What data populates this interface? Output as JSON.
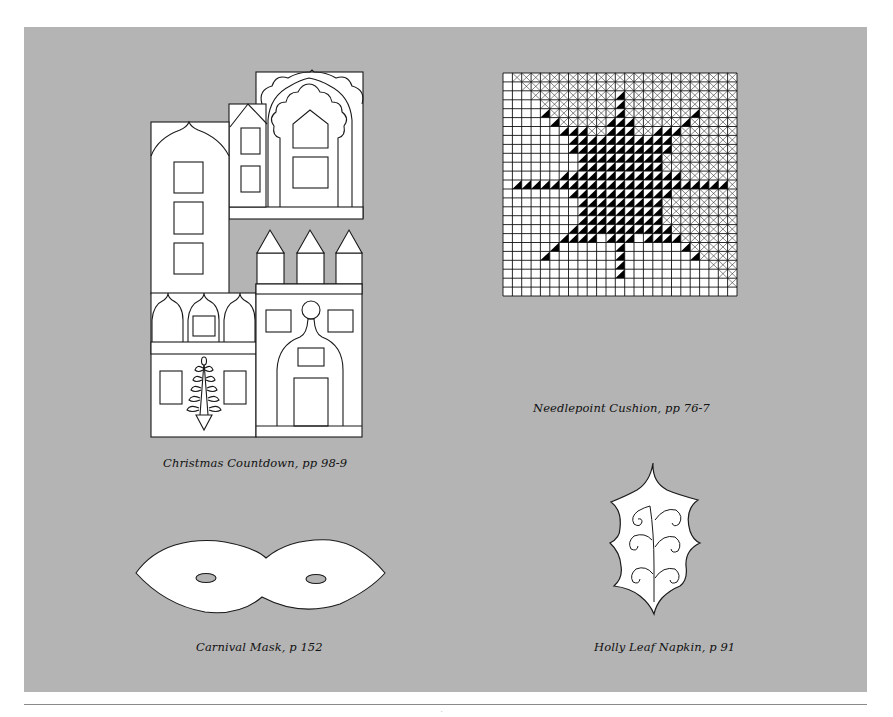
{
  "page": {
    "background": "#ffffff",
    "panel_color": "#b4b4b4",
    "line_color": "#1a1a1a",
    "page_number_fragment": "ʼ"
  },
  "figures": [
    {
      "id": "christmas-countdown",
      "caption": "Christmas Countdown, pp 98-9",
      "icon": "house-facade-template-icon"
    },
    {
      "id": "needlepoint-cushion",
      "caption": "Needlepoint Cushion, pp 76-7",
      "icon": "star-needlepoint-chart-icon"
    },
    {
      "id": "carnival-mask",
      "caption": "Carnival Mask, p 152",
      "icon": "mask-template-icon"
    },
    {
      "id": "holly-leaf-napkin",
      "caption": "Holly Leaf Napkin, p 91",
      "icon": "holly-leaf-template-icon"
    }
  ],
  "needlepoint_grid": {
    "cols": 25,
    "rows": 25,
    "x": 503,
    "y": 73,
    "width": 234,
    "height": 223,
    "crossed_rule": "upper-right region above diagonal",
    "star_rows": [
      [],
      [],
      [
        12,
        12
      ],
      [
        12,
        12
      ],
      [
        4,
        4,
        12,
        12,
        20,
        20
      ],
      [
        5,
        5,
        11,
        13,
        19,
        19
      ],
      [
        6,
        8,
        11,
        13,
        16,
        18
      ],
      [
        7,
        17
      ],
      [
        7,
        17
      ],
      [
        8,
        16
      ],
      [
        8,
        16
      ],
      [
        6,
        18
      ],
      [
        1,
        23
      ],
      [
        7,
        17
      ],
      [
        8,
        16
      ],
      [
        8,
        16
      ],
      [
        8,
        16
      ],
      [
        7,
        17
      ],
      [
        6,
        9,
        11,
        13,
        15,
        18
      ],
      [
        5,
        5,
        12,
        12,
        19,
        19
      ],
      [
        4,
        4,
        12,
        12,
        20,
        20
      ],
      [
        12,
        12
      ],
      [
        12,
        12
      ],
      [],
      []
    ]
  }
}
